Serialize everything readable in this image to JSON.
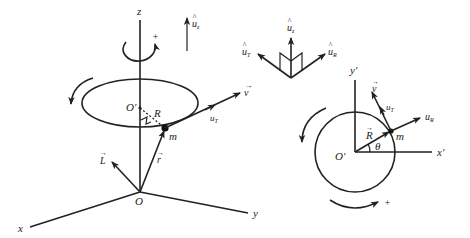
{
  "figure": {
    "type": "physics-diagram"
  },
  "left_diagram": {
    "axis_labels": {
      "z": "z",
      "x": "x",
      "y": "y"
    },
    "origin_label": "O",
    "center_label": "O'",
    "radius_label": "R",
    "mass_label": "m",
    "position_vector_label": "r",
    "angular_momentum_label": "L",
    "velocity_label": "v",
    "tangent_unit_label": "u",
    "tangent_unit_sub": "T",
    "z_unit_label": "u",
    "z_unit_sub": "z",
    "rotation_sign": "+"
  },
  "unit_triad": {
    "uz_label": "u",
    "uz_sub": "z",
    "uT_label": "u",
    "uT_sub": "T",
    "uR_label": "u",
    "uR_sub": "R"
  },
  "right_diagram": {
    "x_axis_label": "x'",
    "y_axis_label": "y'",
    "center_label": "O'",
    "radius_label": "R",
    "angle_label": "θ",
    "mass_label": "m",
    "velocity_label": "v",
    "uT_label": "u",
    "uT_sub": "T",
    "uR_label": "u",
    "uR_sub": "R",
    "rotation_sign": "+"
  },
  "colors": {
    "ink": "#222222",
    "background": "#ffffff"
  }
}
